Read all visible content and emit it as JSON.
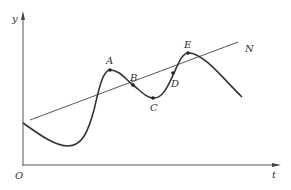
{
  "diagram": {
    "type": "function-graph",
    "axes": {
      "x_label": "t",
      "y_label": "y",
      "origin_label": "O"
    },
    "curve": {
      "description": "oscillating curve crossing a rising trend line N",
      "points": {
        "A": "A",
        "B": "B",
        "C": "C",
        "D": "D",
        "E": "E"
      }
    },
    "trend_line": {
      "label": "N"
    },
    "colors": {
      "stroke": "#333333",
      "axis": "#555555",
      "background": "#ffffff"
    }
  }
}
